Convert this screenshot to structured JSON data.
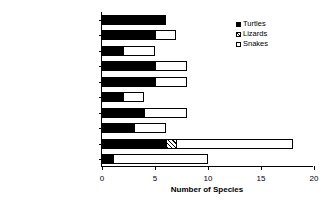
{
  "chart_data": {
    "type": "bar",
    "orientation": "horizontal",
    "stacked": true,
    "title": "",
    "xlabel": "Number of Species",
    "ylabel": "",
    "xlim": [
      0,
      20
    ],
    "xticks": [
      0,
      5,
      10,
      15,
      20
    ],
    "xticklabels": [
      "0",
      "5",
      "10",
      "15",
      "20"
    ],
    "grid": false,
    "legend_position": "top-right",
    "categories": [
      "Estuary",
      "Stream",
      "Bog",
      "Fen",
      "Marsh, pond/lake edge",
      "Vernal pool",
      "Shrub swamp",
      "Forested swamp",
      "Upland shrub/grass",
      "Upland forest"
    ],
    "series": [
      {
        "name": "Turtles",
        "color": "#000000",
        "fill": "solid-black",
        "values": [
          6,
          5,
          2,
          5,
          5,
          2,
          4,
          3,
          6,
          1
        ]
      },
      {
        "name": "Lizards",
        "color": "#000000",
        "fill": "diagonal-hatch",
        "values": [
          0,
          0,
          0,
          0,
          0,
          0,
          0,
          0,
          1,
          0
        ]
      },
      {
        "name": "Snakes",
        "color": "#ffffff",
        "fill": "white-outline",
        "values": [
          0,
          2,
          3,
          3,
          3,
          2,
          4,
          3,
          11,
          9
        ]
      }
    ],
    "totals": [
      6,
      7,
      5,
      8,
      8,
      4,
      8,
      6,
      18,
      10
    ]
  },
  "legend": {
    "items": [
      {
        "label": "Turtles"
      },
      {
        "label": "Lizards"
      },
      {
        "label": "Snakes"
      }
    ]
  }
}
